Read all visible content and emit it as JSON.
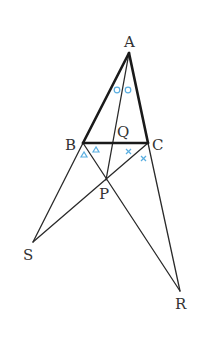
{
  "diagram": {
    "type": "geometry",
    "points": {
      "A": {
        "label": "A",
        "x": 129,
        "y": 53
      },
      "B": {
        "label": "B",
        "x": 83,
        "y": 143
      },
      "C": {
        "label": "C",
        "x": 148,
        "y": 143
      },
      "Q": {
        "label": "Q",
        "x": 118,
        "y": 143
      },
      "P": {
        "label": "P",
        "x": 106,
        "y": 180
      },
      "S": {
        "label": "S",
        "x": 33,
        "y": 242
      },
      "R": {
        "label": "R",
        "x": 180,
        "y": 291
      }
    },
    "segments": [
      {
        "from": "A",
        "to": "B",
        "style": "thick"
      },
      {
        "from": "A",
        "to": "C",
        "style": "thick"
      },
      {
        "from": "B",
        "to": "C",
        "style": "thick"
      },
      {
        "from": "A",
        "to": "P",
        "style": "thin",
        "through": "Q"
      },
      {
        "from": "B",
        "to": "R",
        "style": "thin",
        "through": "P"
      },
      {
        "from": "C",
        "to": "S",
        "style": "thin",
        "through": "P"
      },
      {
        "from": "B",
        "to": "S",
        "style": "thin"
      },
      {
        "from": "C",
        "to": "R",
        "style": "thin"
      }
    ],
    "angle_marks": [
      {
        "symbol": "circle",
        "at": "A",
        "count": 2,
        "meaning": "∠BAQ = ∠QAC"
      },
      {
        "symbol": "triangle",
        "at": "B",
        "count": 2,
        "meaning": "∠SBP = ∠PBC"
      },
      {
        "symbol": "cross",
        "at": "C",
        "count": 2,
        "meaning": "∠BCP = ∠PCR"
      }
    ],
    "mark_color": "#5aaee0",
    "labels": {
      "A": "A",
      "B": "B",
      "C": "C",
      "Q": "Q",
      "P": "P",
      "S": "S",
      "R": "R"
    }
  }
}
